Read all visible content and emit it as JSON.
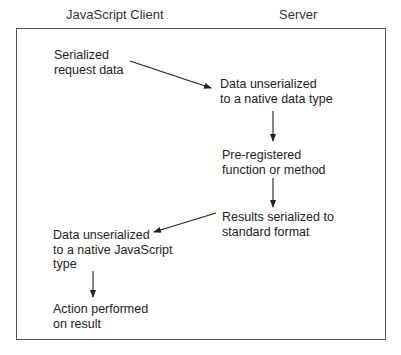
{
  "columns": {
    "client": "JavaScript Client",
    "server": "Server"
  },
  "nodes": {
    "serialized_request": "Serialized\nrequest data",
    "server_unserialize": "Data unserialized\nto a native data type",
    "preregistered_function": "Pre-registered\nfunction or method",
    "results_serialized": "Results serialized to\nstandard format",
    "client_unserialize": "Data unserialized\nto a native JavaScript\ntype",
    "action_performed": "Action performed\non result"
  },
  "edges": [
    {
      "from": "serialized_request",
      "to": "server_unserialize"
    },
    {
      "from": "server_unserialize",
      "to": "preregistered_function"
    },
    {
      "from": "preregistered_function",
      "to": "results_serialized"
    },
    {
      "from": "results_serialized",
      "to": "client_unserialize"
    },
    {
      "from": "client_unserialize",
      "to": "action_performed"
    }
  ]
}
